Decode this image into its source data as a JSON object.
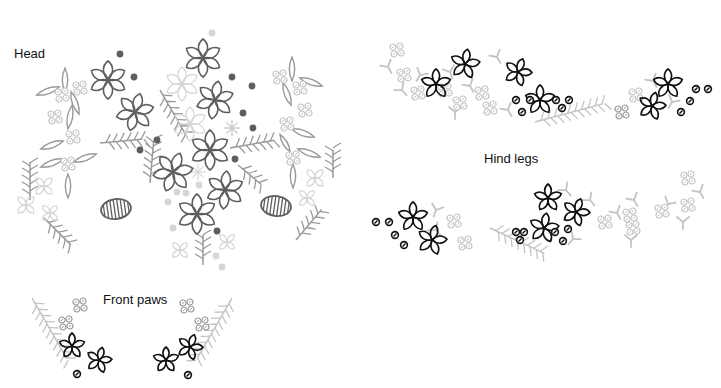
{
  "labels": {
    "head": "Head",
    "hind_legs": "Hind legs",
    "front_paws": "Front paws"
  },
  "colors": {
    "dark": "#5e5e5e",
    "black": "#111111",
    "mid": "#9a9a9a",
    "light": "#c4c4c4",
    "pale": "#d6d6d6"
  },
  "sections": [
    {
      "name": "head",
      "flowers6": [
        {
          "x": 108,
          "y": 80,
          "r": 19,
          "rot": 0,
          "c": "dark"
        },
        {
          "x": 135,
          "y": 112,
          "r": 19,
          "rot": 15,
          "c": "dark"
        },
        {
          "x": 203,
          "y": 58,
          "r": 19,
          "rot": 0,
          "c": "dark"
        },
        {
          "x": 215,
          "y": 100,
          "r": 19,
          "rot": 10,
          "c": "dark"
        },
        {
          "x": 210,
          "y": 150,
          "r": 20,
          "rot": 0,
          "c": "dark"
        },
        {
          "x": 173,
          "y": 172,
          "r": 20,
          "rot": 20,
          "c": "dark"
        },
        {
          "x": 225,
          "y": 190,
          "r": 19,
          "rot": 5,
          "c": "dark"
        },
        {
          "x": 197,
          "y": 214,
          "r": 20,
          "rot": 0,
          "c": "dark"
        },
        {
          "x": 182,
          "y": 84,
          "r": 17,
          "rot": 0,
          "c": "pale"
        },
        {
          "x": 190,
          "y": 124,
          "r": 17,
          "rot": 0,
          "c": "pale"
        }
      ],
      "stars": [
        {
          "x": 232,
          "y": 128,
          "r": 8,
          "c": "light"
        },
        {
          "x": 198,
          "y": 172,
          "r": 8,
          "c": "pale"
        }
      ],
      "dots": [
        {
          "x": 120,
          "y": 54,
          "c": "dark"
        },
        {
          "x": 134,
          "y": 77,
          "c": "dark"
        },
        {
          "x": 232,
          "y": 77,
          "c": "dark"
        },
        {
          "x": 252,
          "y": 86,
          "c": "dark"
        },
        {
          "x": 243,
          "y": 113,
          "c": "dark"
        },
        {
          "x": 253,
          "y": 128,
          "c": "dark"
        },
        {
          "x": 157,
          "y": 140,
          "c": "dark"
        },
        {
          "x": 140,
          "y": 150,
          "c": "dark"
        },
        {
          "x": 235,
          "y": 159,
          "c": "dark"
        },
        {
          "x": 217,
          "y": 231,
          "c": "dark"
        },
        {
          "x": 212,
          "y": 33,
          "c": "pale"
        },
        {
          "x": 177,
          "y": 192,
          "c": "pale"
        },
        {
          "x": 186,
          "y": 193,
          "c": "pale"
        },
        {
          "x": 168,
          "y": 202,
          "c": "pale"
        },
        {
          "x": 199,
          "y": 185,
          "c": "pale"
        },
        {
          "x": 173,
          "y": 228,
          "c": "pale"
        },
        {
          "x": 216,
          "y": 256,
          "c": "pale"
        },
        {
          "x": 222,
          "y": 267,
          "c": "pale"
        }
      ],
      "ovals": [
        {
          "x": 116,
          "y": 209,
          "rx": 15,
          "ry": 10,
          "rot": -8
        },
        {
          "x": 276,
          "y": 206,
          "rx": 15,
          "ry": 10,
          "rot": 8
        }
      ],
      "leaves": [
        {
          "x": 65,
          "y": 80,
          "len": 12,
          "rot": 90,
          "c": "mid"
        },
        {
          "x": 48,
          "y": 91,
          "len": 12,
          "rot": -20,
          "c": "mid"
        },
        {
          "x": 75,
          "y": 103,
          "len": 12,
          "rot": 70,
          "c": "mid"
        },
        {
          "x": 70,
          "y": 117,
          "len": 12,
          "rot": 100,
          "c": "mid"
        },
        {
          "x": 52,
          "y": 145,
          "len": 12,
          "rot": -20,
          "c": "mid"
        },
        {
          "x": 52,
          "y": 163,
          "len": 12,
          "rot": -20,
          "c": "mid"
        },
        {
          "x": 85,
          "y": 158,
          "len": 12,
          "rot": -20,
          "c": "mid"
        },
        {
          "x": 68,
          "y": 186,
          "len": 12,
          "rot": 90,
          "c": "mid"
        },
        {
          "x": 292,
          "y": 69,
          "len": 12,
          "rot": 90,
          "c": "mid"
        },
        {
          "x": 311,
          "y": 82,
          "len": 12,
          "rot": 20,
          "c": "mid"
        },
        {
          "x": 287,
          "y": 94,
          "len": 12,
          "rot": 70,
          "c": "mid"
        },
        {
          "x": 303,
          "y": 133,
          "len": 12,
          "rot": 20,
          "c": "mid"
        },
        {
          "x": 309,
          "y": 153,
          "len": 12,
          "rot": 20,
          "c": "mid"
        },
        {
          "x": 293,
          "y": 176,
          "len": 12,
          "rot": 90,
          "c": "mid"
        },
        {
          "x": 285,
          "y": 143,
          "len": 10,
          "rot": 60,
          "c": "mid"
        }
      ],
      "clusters": [
        {
          "x": 62,
          "y": 95,
          "c": "light"
        },
        {
          "x": 80,
          "y": 88,
          "c": "light"
        },
        {
          "x": 55,
          "y": 117,
          "c": "light"
        },
        {
          "x": 73,
          "y": 137,
          "c": "light"
        },
        {
          "x": 68,
          "y": 164,
          "c": "light"
        },
        {
          "x": 280,
          "y": 77,
          "c": "light"
        },
        {
          "x": 300,
          "y": 88,
          "c": "light"
        },
        {
          "x": 305,
          "y": 110,
          "c": "light"
        },
        {
          "x": 287,
          "y": 124,
          "c": "light"
        },
        {
          "x": 293,
          "y": 158,
          "c": "light"
        }
      ],
      "sprigs": [
        {
          "x": 30,
          "y": 200,
          "len": 38,
          "rot": -90,
          "c": "mid"
        },
        {
          "x": 44,
          "y": 218,
          "len": 38,
          "rot": 45,
          "c": "mid"
        },
        {
          "x": 100,
          "y": 143,
          "len": 42,
          "rot": -5,
          "c": "mid"
        },
        {
          "x": 150,
          "y": 183,
          "len": 42,
          "rot": -85,
          "c": "mid"
        },
        {
          "x": 160,
          "y": 90,
          "len": 55,
          "rot": 60,
          "c": "mid"
        },
        {
          "x": 230,
          "y": 148,
          "len": 45,
          "rot": -10,
          "c": "mid"
        },
        {
          "x": 238,
          "y": 165,
          "len": 30,
          "rot": 40,
          "c": "mid"
        },
        {
          "x": 203,
          "y": 265,
          "len": 30,
          "rot": -90,
          "c": "mid"
        },
        {
          "x": 333,
          "y": 178,
          "len": 28,
          "rot": -90,
          "c": "mid"
        },
        {
          "x": 296,
          "y": 240,
          "len": 40,
          "rot": -50,
          "c": "mid"
        }
      ],
      "lightflowers": [
        {
          "x": 44,
          "y": 186,
          "r": 11,
          "c": "pale"
        },
        {
          "x": 26,
          "y": 205,
          "r": 11,
          "c": "pale"
        },
        {
          "x": 50,
          "y": 213,
          "r": 10,
          "c": "pale"
        },
        {
          "x": 315,
          "y": 178,
          "r": 11,
          "c": "pale"
        },
        {
          "x": 307,
          "y": 198,
          "r": 10,
          "c": "pale"
        },
        {
          "x": 180,
          "y": 250,
          "r": 10,
          "c": "pale"
        },
        {
          "x": 227,
          "y": 242,
          "r": 10,
          "c": "pale"
        }
      ]
    },
    {
      "name": "hind-legs-top",
      "flowers5": [
        {
          "x": 436,
          "y": 84,
          "r": 15,
          "rot": 0,
          "c": "black"
        },
        {
          "x": 465,
          "y": 64,
          "r": 15,
          "rot": 10,
          "c": "black"
        },
        {
          "x": 540,
          "y": 100,
          "r": 15,
          "rot": 0,
          "c": "black"
        },
        {
          "x": 518,
          "y": 72,
          "r": 14,
          "rot": 20,
          "c": "black"
        },
        {
          "x": 668,
          "y": 84,
          "r": 15,
          "rot": 0,
          "c": "black"
        },
        {
          "x": 652,
          "y": 106,
          "r": 14,
          "rot": 15,
          "c": "black"
        }
      ],
      "dots": [
        {
          "x": 516,
          "y": 100,
          "c": "black"
        },
        {
          "x": 522,
          "y": 112,
          "c": "black"
        },
        {
          "x": 530,
          "y": 100,
          "c": "black"
        },
        {
          "x": 556,
          "y": 100,
          "c": "black"
        },
        {
          "x": 562,
          "y": 108,
          "c": "black"
        },
        {
          "x": 569,
          "y": 100,
          "c": "black"
        },
        {
          "x": 696,
          "y": 89,
          "c": "black"
        },
        {
          "x": 708,
          "y": 89,
          "c": "black"
        },
        {
          "x": 690,
          "y": 101,
          "c": "black"
        },
        {
          "x": 681,
          "y": 112,
          "c": "black"
        }
      ],
      "clusters": [
        {
          "x": 397,
          "y": 50,
          "c": "light"
        },
        {
          "x": 404,
          "y": 75,
          "c": "light"
        },
        {
          "x": 418,
          "y": 93,
          "c": "light"
        },
        {
          "x": 445,
          "y": 90,
          "c": "light"
        },
        {
          "x": 460,
          "y": 103,
          "c": "light"
        },
        {
          "x": 482,
          "y": 93,
          "c": "light"
        },
        {
          "x": 490,
          "y": 108,
          "c": "light"
        },
        {
          "x": 622,
          "y": 112,
          "c": "mid"
        },
        {
          "x": 636,
          "y": 95,
          "c": "light"
        }
      ],
      "ys": [
        {
          "x": 388,
          "y": 67,
          "rot": -30,
          "c": "light"
        },
        {
          "x": 420,
          "y": 75,
          "rot": 30,
          "c": "light"
        },
        {
          "x": 402,
          "y": 90,
          "rot": -40,
          "c": "light"
        },
        {
          "x": 450,
          "y": 72,
          "rot": -20,
          "c": "light"
        },
        {
          "x": 470,
          "y": 86,
          "rot": -30,
          "c": "light"
        },
        {
          "x": 455,
          "y": 112,
          "rot": 0,
          "c": "light"
        },
        {
          "x": 508,
          "y": 110,
          "rot": -30,
          "c": "light"
        },
        {
          "x": 497,
          "y": 57,
          "rot": -30,
          "c": "light"
        },
        {
          "x": 653,
          "y": 81,
          "rot": -30,
          "c": "light"
        },
        {
          "x": 672,
          "y": 102,
          "rot": 30,
          "c": "light"
        }
      ],
      "sprigs": [
        {
          "x": 535,
          "y": 122,
          "len": 70,
          "rot": -15,
          "c": "light"
        }
      ]
    },
    {
      "name": "hind-legs-bottom",
      "flowers5": [
        {
          "x": 413,
          "y": 217,
          "r": 15,
          "rot": 0,
          "c": "black"
        },
        {
          "x": 432,
          "y": 240,
          "r": 15,
          "rot": 15,
          "c": "black"
        },
        {
          "x": 548,
          "y": 198,
          "r": 14,
          "rot": 0,
          "c": "black"
        },
        {
          "x": 576,
          "y": 212,
          "r": 14,
          "rot": 20,
          "c": "black"
        },
        {
          "x": 544,
          "y": 228,
          "r": 15,
          "rot": 10,
          "c": "black"
        }
      ],
      "dots": [
        {
          "x": 376,
          "y": 222,
          "c": "black"
        },
        {
          "x": 389,
          "y": 222,
          "c": "black"
        },
        {
          "x": 395,
          "y": 235,
          "c": "black"
        },
        {
          "x": 404,
          "y": 245,
          "c": "black"
        },
        {
          "x": 516,
          "y": 232,
          "c": "black"
        },
        {
          "x": 524,
          "y": 232,
          "c": "black"
        },
        {
          "x": 520,
          "y": 240,
          "c": "black"
        },
        {
          "x": 555,
          "y": 232,
          "c": "black"
        },
        {
          "x": 563,
          "y": 241,
          "c": "black"
        },
        {
          "x": 568,
          "y": 229,
          "c": "black"
        }
      ],
      "clusters": [
        {
          "x": 454,
          "y": 221,
          "c": "light"
        },
        {
          "x": 465,
          "y": 243,
          "c": "light"
        },
        {
          "x": 605,
          "y": 222,
          "c": "light"
        },
        {
          "x": 630,
          "y": 215,
          "c": "light"
        },
        {
          "x": 633,
          "y": 228,
          "c": "light"
        },
        {
          "x": 662,
          "y": 211,
          "c": "light"
        },
        {
          "x": 688,
          "y": 178,
          "c": "light"
        },
        {
          "x": 688,
          "y": 205,
          "c": "light"
        }
      ],
      "ys": [
        {
          "x": 436,
          "y": 230,
          "rot": -40,
          "c": "light"
        },
        {
          "x": 436,
          "y": 210,
          "rot": 20,
          "c": "light"
        },
        {
          "x": 566,
          "y": 190,
          "rot": -40,
          "c": "light"
        },
        {
          "x": 590,
          "y": 200,
          "rot": -40,
          "c": "light"
        },
        {
          "x": 573,
          "y": 239,
          "rot": 40,
          "c": "light"
        },
        {
          "x": 617,
          "y": 213,
          "rot": -30,
          "c": "light"
        },
        {
          "x": 631,
          "y": 240,
          "rot": 0,
          "c": "light"
        },
        {
          "x": 634,
          "y": 200,
          "rot": -30,
          "c": "light"
        },
        {
          "x": 668,
          "y": 204,
          "rot": 30,
          "c": "light"
        },
        {
          "x": 683,
          "y": 222,
          "rot": 0,
          "c": "light"
        },
        {
          "x": 700,
          "y": 192,
          "rot": -30,
          "c": "light"
        }
      ],
      "sprigs": [
        {
          "x": 490,
          "y": 228,
          "len": 60,
          "rot": 25,
          "c": "light"
        }
      ]
    },
    {
      "name": "front-paws",
      "flowers5": [
        {
          "x": 72,
          "y": 346,
          "r": 13,
          "rot": 0,
          "c": "black"
        },
        {
          "x": 99,
          "y": 360,
          "r": 13,
          "rot": 15,
          "c": "black"
        },
        {
          "x": 166,
          "y": 360,
          "r": 13,
          "rot": 0,
          "c": "black"
        },
        {
          "x": 190,
          "y": 347,
          "r": 13,
          "rot": 20,
          "c": "black"
        }
      ],
      "dots": [
        {
          "x": 77,
          "y": 374,
          "c": "black"
        },
        {
          "x": 188,
          "y": 375,
          "c": "black"
        }
      ],
      "clusters": [
        {
          "x": 80,
          "y": 305,
          "c": "mid"
        },
        {
          "x": 66,
          "y": 323,
          "c": "mid"
        },
        {
          "x": 187,
          "y": 306,
          "c": "mid"
        },
        {
          "x": 202,
          "y": 324,
          "c": "mid"
        }
      ],
      "sprigs": [
        {
          "x": 32,
          "y": 298,
          "len": 70,
          "rot": 60,
          "c": "light"
        },
        {
          "x": 232,
          "y": 298,
          "len": 70,
          "rot": 120,
          "c": "light"
        }
      ]
    }
  ]
}
